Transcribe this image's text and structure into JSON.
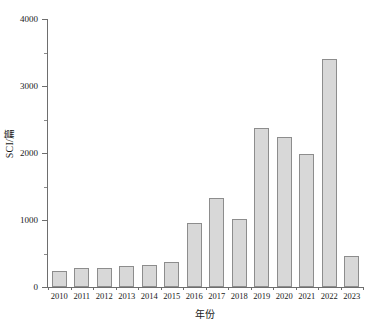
{
  "chart_data": {
    "type": "bar",
    "title": "",
    "subtitle": "",
    "xlabel": "年份",
    "ylabel": "SCI/篇",
    "categories": [
      "2010",
      "2011",
      "2012",
      "2013",
      "2014",
      "2015",
      "2016",
      "2017",
      "2018",
      "2019",
      "2020",
      "2021",
      "2022",
      "2023"
    ],
    "values": [
      240,
      290,
      290,
      310,
      330,
      370,
      960,
      1330,
      1020,
      2380,
      2240,
      1990,
      3400,
      460
    ],
    "series": [
      {
        "name": "SCI",
        "values": [
          240,
          290,
          290,
          310,
          330,
          370,
          960,
          1330,
          1020,
          2380,
          2240,
          1990,
          3400,
          460
        ]
      }
    ],
    "ylim": [
      0,
      4000
    ],
    "ytick_labels": [
      "0",
      "1000",
      "2000",
      "3000",
      "4000"
    ],
    "ytick_values": [
      0,
      1000,
      2000,
      3000,
      4000
    ],
    "yminor_values": [
      500,
      1500,
      2500,
      3500
    ],
    "grid": false,
    "legend": false,
    "legend_position": "none",
    "bar_fill_color": "#d8d8d8",
    "bar_edge_color": "#8d8d8d",
    "axis_color": "#6e6e6e",
    "text_color": "#1a1a1a",
    "background_color": "#ffffff"
  }
}
